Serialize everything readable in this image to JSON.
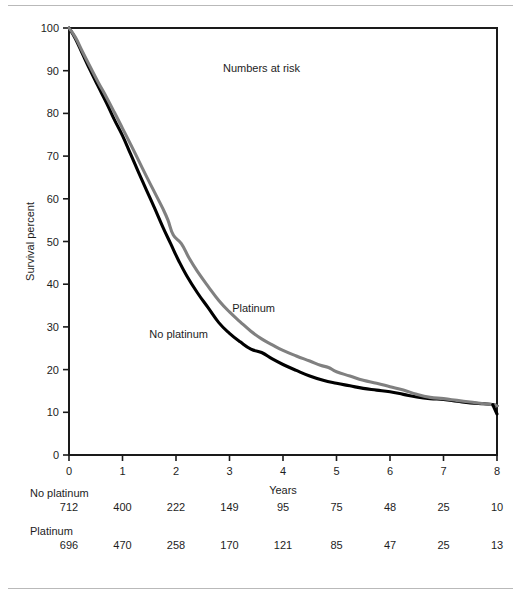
{
  "chart_data": {
    "type": "line",
    "title": "",
    "xlabel": "Years",
    "ylabel": "Survival percent",
    "xlim": [
      0,
      8
    ],
    "ylim": [
      0,
      100
    ],
    "xticks": [
      0,
      1,
      2,
      3,
      4,
      5,
      6,
      7,
      8
    ],
    "yticks": [
      0,
      10,
      20,
      30,
      40,
      50,
      60,
      70,
      80,
      90,
      100
    ],
    "grid": false,
    "legend_position": "inline-annotations",
    "series": [
      {
        "name": "No platinum",
        "color": "#000000",
        "label_x": 2.05,
        "label_y": 27.5,
        "x": [
          0,
          0.12,
          0.25,
          0.4,
          0.55,
          0.7,
          0.85,
          1.0,
          1.15,
          1.3,
          1.45,
          1.6,
          1.75,
          1.9,
          2.05,
          2.2,
          2.4,
          2.6,
          2.8,
          3.0,
          3.2,
          3.4,
          3.6,
          3.8,
          4.0,
          4.25,
          4.5,
          4.75,
          5.0,
          5.25,
          5.5,
          5.75,
          6.0,
          6.25,
          6.5,
          6.75,
          7.0,
          7.25,
          7.5,
          7.75,
          7.92,
          8.0
        ],
        "y": [
          100,
          97.5,
          94,
          90,
          86.2,
          82.5,
          78.5,
          74.8,
          70.5,
          66.2,
          62,
          57.8,
          53.5,
          49.5,
          45.5,
          42,
          38,
          34.5,
          31,
          28.5,
          26.5,
          24.8,
          24.0,
          22.5,
          21.2,
          19.8,
          18.5,
          17.5,
          16.8,
          16.2,
          15.6,
          15.2,
          14.8,
          14.2,
          13.6,
          13.2,
          13.0,
          12.6,
          12.2,
          12.0,
          11.8,
          11.5
        ]
      },
      {
        "name": "Platinum",
        "color": "#808080",
        "label_x": 3.05,
        "label_y": 33.5,
        "x": [
          0,
          0.12,
          0.25,
          0.4,
          0.55,
          0.7,
          0.85,
          1.0,
          1.15,
          1.3,
          1.45,
          1.6,
          1.75,
          1.85,
          1.95,
          2.1,
          2.25,
          2.4,
          2.6,
          2.8,
          3.0,
          3.2,
          3.4,
          3.6,
          3.8,
          4.0,
          4.25,
          4.5,
          4.7,
          4.85,
          5.0,
          5.25,
          5.5,
          5.75,
          6.0,
          6.25,
          6.5,
          6.75,
          7.0,
          7.25,
          7.5,
          7.75,
          7.92,
          8.0
        ],
        "y": [
          100,
          97.8,
          94.5,
          90.8,
          87.2,
          83.8,
          80.2,
          76.5,
          72.8,
          69.0,
          65.2,
          61.5,
          57.8,
          55.0,
          51.5,
          49.5,
          46.0,
          43.0,
          39.5,
          36.2,
          33.5,
          31.2,
          29.0,
          27.2,
          25.8,
          24.5,
          23.2,
          22.0,
          21.0,
          20.5,
          19.5,
          18.5,
          17.5,
          16.8,
          16.0,
          15.2,
          14.2,
          13.5,
          13.2,
          12.8,
          12.4,
          12.0,
          11.8,
          11.5
        ]
      }
    ]
  },
  "risk_table": {
    "caption": "Numbers at risk",
    "x_positions": [
      0,
      1,
      2,
      3,
      4,
      5,
      6,
      7,
      8
    ],
    "rows": [
      {
        "group": "No platinum",
        "values": [
          "712",
          "400",
          "222",
          "149",
          "95",
          "75",
          "48",
          "25",
          "10"
        ]
      },
      {
        "group": "Platinum",
        "values": [
          "696",
          "470",
          "258",
          "170",
          "121",
          "85",
          "47",
          "25",
          "13"
        ]
      }
    ]
  }
}
